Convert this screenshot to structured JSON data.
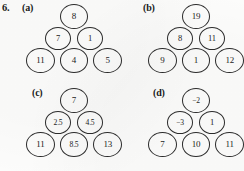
{
  "problem": {
    "number": "6."
  },
  "panels": [
    {
      "label": "(a)",
      "rows": [
        [
          "8"
        ],
        [
          "7",
          "1"
        ],
        [
          "11",
          "4",
          "5"
        ]
      ]
    },
    {
      "label": "(b)",
      "rows": [
        [
          "19"
        ],
        [
          "8",
          "11"
        ],
        [
          "9",
          "1",
          "12"
        ]
      ]
    },
    {
      "label": "(c)",
      "rows": [
        [
          "7"
        ],
        [
          "2.5",
          "4.5"
        ],
        [
          "11",
          "8.5",
          "13"
        ]
      ]
    },
    {
      "label": "(d)",
      "rows": [
        [
          "−2"
        ],
        [
          "−3",
          "1"
        ],
        [
          "7",
          "10",
          "11"
        ]
      ]
    }
  ],
  "colors": {
    "ink": "#1b1b1b",
    "stroke": "#2b2b2b",
    "paper": "#fdfdfc"
  }
}
